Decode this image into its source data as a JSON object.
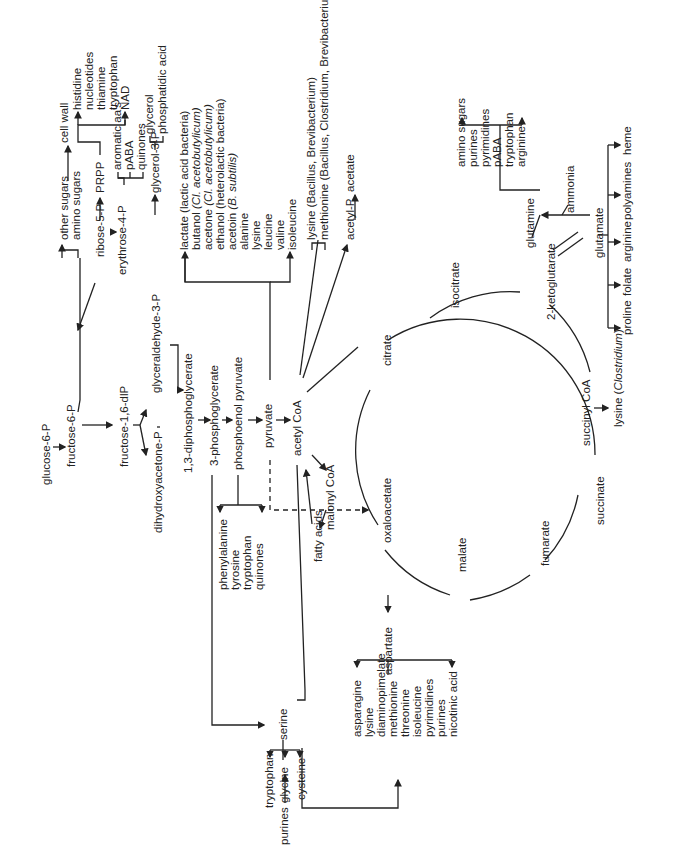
{
  "diagram": {
    "orientation": "rotated 90° counter-clockwise",
    "glycolysis": [
      "glucose-6-P",
      "fructose-6-P",
      "fructose-1,6-dlP",
      "dihydroxyacetone-P",
      "glyceraldehyde-3-P",
      "1,3-diphosphoglycerate",
      "3-phosphoglycerate",
      "phosphoenol pyruvate",
      "pyruvate",
      "acetyl CoA"
    ],
    "branches": {
      "fructose6p_products": [
        "other sugars",
        "amino sugars"
      ],
      "cell_wall": "cell wall",
      "ribose": "ribose-5-P",
      "prpp": "PRPP",
      "prpp_products": [
        "histidine",
        "nucleotides",
        "thiamine",
        "tryptophan",
        "NAD"
      ],
      "erythrose": "erythrose-4-P",
      "erythrose_products": [
        "aromatic aa's",
        "pABA",
        "quinones"
      ],
      "glycerol3p": "glycerol-3-P",
      "glycerol_products": [
        "glycerol",
        "phosphatidic acid"
      ],
      "pyruvate_products": [
        {
          "name": "lactate",
          "note": "(lactic acid bacteria)"
        },
        {
          "name": "butanol",
          "note": "(Cl. acetobutylicum)"
        },
        {
          "name": "acetone",
          "note": "(Cl. acetobutylicum)"
        },
        {
          "name": "ethanol",
          "note": "(heterolactic bacteria)"
        },
        {
          "name": "acetoin",
          "note": "(B. subtilis)"
        },
        {
          "name": "alanine",
          "note": ""
        },
        {
          "name": "lysine",
          "note": ""
        },
        {
          "name": "leucine",
          "note": ""
        },
        {
          "name": "valine",
          "note": ""
        },
        {
          "name": "isoleucine",
          "note": ""
        }
      ],
      "acetylcoa_products": [
        "lysine (Bacillus, Brevibacterium)",
        "methionine (Bacillus, Clostridium, Brevibacterium)"
      ],
      "acetyl_p": "acetyl-P",
      "acetate": "acetate",
      "malonyl": "malonyl CoA",
      "fatty_acids": "fatty acids",
      "pep_products": [
        "phenylalanine",
        "tyrosine",
        "tryptophan",
        "quinones"
      ],
      "serine": "serine",
      "serine_products": [
        "tryptophan",
        "glycine",
        "cysteine"
      ],
      "purines": "purines",
      "aspartate": "aspartate",
      "aspartate_products": [
        "asparagine",
        "lysine",
        "diaminopimelate",
        "methionine",
        "threonine",
        "isoleucine",
        "pyrimidines",
        "purines",
        "nicotinic acid"
      ]
    },
    "tca_cycle": [
      "citrate",
      "isocitrate",
      "2-ketoglutarate",
      "succinyl CoA",
      "succinate",
      "fumarate",
      "malate",
      "oxaloacetate"
    ],
    "succinyl_product": "lysine (Clostridium)",
    "glutamate": "glutamate",
    "glutamine": "glutamine",
    "ammonia": "ammonia",
    "glutamine_products": [
      "amino sugars",
      "purines",
      "pyrimidines",
      "pABA",
      "tryptophan",
      "arginine"
    ],
    "glutamate_products": [
      "proline",
      "folate",
      "arginine",
      "polyamines",
      "heme"
    ]
  }
}
